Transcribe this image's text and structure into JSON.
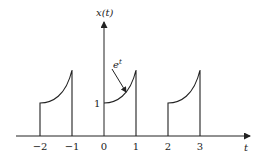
{
  "figure": {
    "y_axis_label": "x(t)",
    "x_axis_label": "t",
    "annotation": "e",
    "annotation_sup": "t",
    "level_label": "1",
    "ticks": [
      "−2",
      "−1",
      "0",
      "1",
      "2",
      "3"
    ]
  },
  "colors": {
    "stroke": "#222222",
    "background": "#ffffff"
  }
}
